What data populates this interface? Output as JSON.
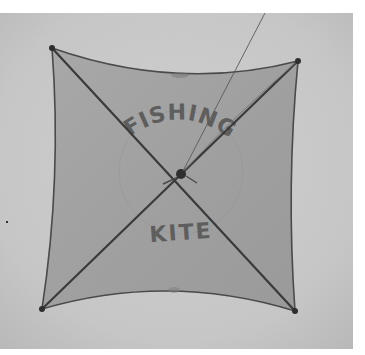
{
  "scene": {
    "description": "Black-and-white photograph of a square fishing kite flying in the sky",
    "colors": {
      "border": "#ffffff",
      "sky": "#c8c8c8",
      "sky_light": "#d4d4d4",
      "sky_dark": "#bcbcbc",
      "kite_fabric": "#a0a0a0",
      "kite_edge": "#4a4a4a",
      "spar": "#3a3a3a",
      "string": "#5a5a5a",
      "lettering": "#5e5e5e"
    }
  },
  "kite": {
    "lettering_top": "FISHING",
    "lettering_bottom": "KITE"
  }
}
